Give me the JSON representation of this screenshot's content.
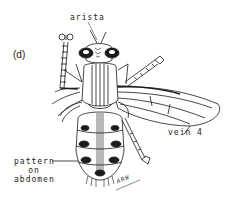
{
  "figure": {
    "panel_label": "(d)",
    "labels": {
      "arista": "arista",
      "vein": "vein 4",
      "pattern_line1": "pattern",
      "pattern_line2": "on",
      "pattern_line3": "abdomen"
    },
    "signature": "ARW",
    "colors": {
      "ink": "#1a1a1a",
      "background": "#ffffff",
      "stipple": "#9a9a9a"
    }
  }
}
